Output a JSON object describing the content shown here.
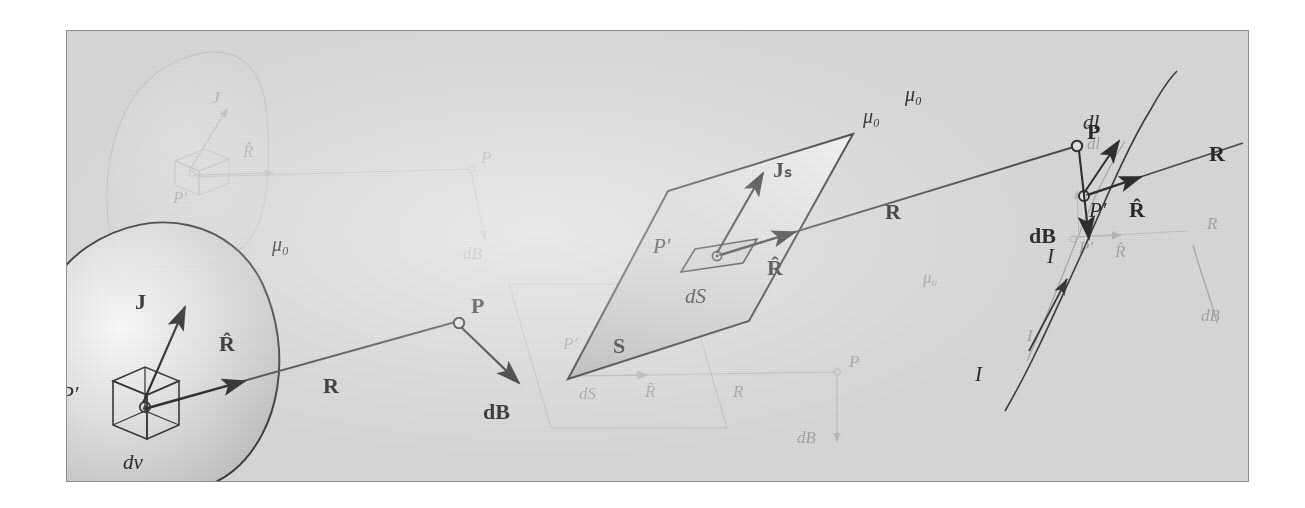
{
  "figure": {
    "frame": {
      "border_color": "#8d8d8d",
      "background_color": "#d9d9d9"
    },
    "ink_color": "#2b2b2b"
  },
  "volume_source": {
    "region_label": "μ₀",
    "source_point_label": "P′",
    "element_label": "dv",
    "current_density_label": "J",
    "unit_vector_label": "R̂",
    "distance_label": "R",
    "field_point_label": "P",
    "field_label": "dB"
  },
  "surface_source": {
    "region_label": "μ₀",
    "surface_label": "S",
    "source_point_label": "P′",
    "element_label": "dS",
    "current_density_label": "Jₛ",
    "unit_vector_label": "R̂",
    "distance_label": "R",
    "field_point_label": "P",
    "field_label": "dB"
  },
  "line_source": {
    "region_label": "μ₀",
    "current_label": "I",
    "source_point_label": "P′",
    "element_label": "dl",
    "unit_vector_label": "R̂",
    "distance_label": "R",
    "field_point_label": "P",
    "field_label": "dB"
  },
  "ghost_layer": {
    "region_label": "μ₀",
    "current_density_label": "J",
    "unit_vector_label": "R̂",
    "source_point_label": "P′",
    "element_volume_label": "dv",
    "element_surface_label": "dS",
    "element_line_label": "dl",
    "distance_label": "R",
    "field_point_label": "P",
    "field_label": "dB",
    "current_label": "I",
    "surface_label": "S"
  }
}
